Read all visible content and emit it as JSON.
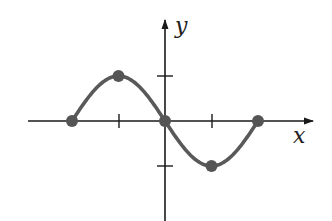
{
  "chart_data": {
    "type": "line",
    "title": "",
    "xlabel": "x",
    "ylabel": "y",
    "grid": false,
    "legend": null,
    "x_ticks": [
      -1,
      1
    ],
    "y_ticks": [
      1,
      -1
    ],
    "xlim": [
      -3,
      3.3
    ],
    "ylim": [
      -2.2,
      2.4
    ],
    "series": [
      {
        "name": "curve",
        "curve": "y = -sin(pi*x/2)",
        "x": [
          -2,
          -1,
          0,
          1,
          2
        ],
        "y": [
          0,
          1,
          0,
          -1,
          0
        ],
        "marked_points": [
          [
            -2,
            0
          ],
          [
            -1,
            1
          ],
          [
            0,
            0
          ],
          [
            1,
            -1
          ],
          [
            2,
            0
          ]
        ]
      }
    ],
    "colors": {
      "curve": "#595959",
      "points": "#555555",
      "axes": "#1a1a1a"
    }
  },
  "labels": {
    "x_axis": "x",
    "y_axis": "y"
  }
}
